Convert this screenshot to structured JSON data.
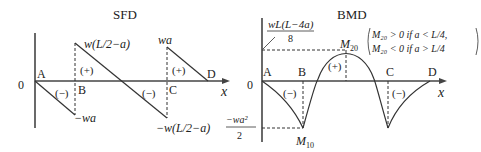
{
  "sfd": {
    "title": "SFD",
    "origin_label": "0",
    "axis_label": "x",
    "points": {
      "A": "A",
      "B": "B",
      "C": "C",
      "D": "D"
    },
    "values": {
      "b_top": "w(L/2−a)",
      "b_bottom": "−wa",
      "c_top": "wa",
      "c_bottom": "−w(L/2−a)"
    },
    "signs": {
      "ab": "(−)",
      "b_plus": "(+)",
      "bc_minus": "(−)",
      "cd": "(+)"
    }
  },
  "bmd": {
    "title": "BMD",
    "origin_label": "0",
    "axis_label": "x",
    "points": {
      "A": "A",
      "B": "B",
      "C": "C",
      "D": "D"
    },
    "peak_label_num": "wL(L−4a)",
    "peak_label_den": "8",
    "min_label_num": "−wa²",
    "min_label_den": "2",
    "m10": "M",
    "m10_sub": "10",
    "m20": "M",
    "m20_sub": "20",
    "signs": {
      "ab": "(−)",
      "mid": "(+)",
      "cd": "(−)"
    },
    "condition_1": "M₂₀ > 0  if a < L/4,",
    "condition_2": "M₂₀ < 0  if a > L/4"
  }
}
